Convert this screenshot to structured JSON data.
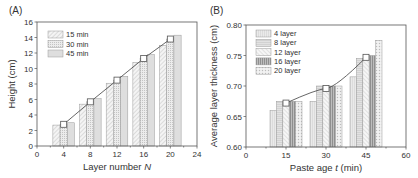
{
  "chart_data": [
    {
      "type": "bar",
      "panel": "(A)",
      "title": "",
      "xlabel": "Layer number",
      "xlabel_italic": "N",
      "ylabel": "Height (cm)",
      "xlim": [
        0,
        24
      ],
      "ylim": [
        0,
        16
      ],
      "xticks": [
        "0",
        "4",
        "8",
        "12",
        "16",
        "20",
        "24"
      ],
      "yticks": [
        "0",
        "2",
        "4",
        "6",
        "8",
        "10",
        "12",
        "14",
        "16"
      ],
      "categories": [
        4,
        8,
        12,
        16,
        20
      ],
      "series": [
        {
          "name": "15 min",
          "values": [
            2.7,
            5.4,
            8.1,
            10.8,
            13.0
          ]
        },
        {
          "name": "30 min",
          "values": [
            2.8,
            5.7,
            8.5,
            11.3,
            13.8
          ]
        },
        {
          "name": "45 min",
          "values": [
            3.0,
            6.1,
            9.0,
            11.8,
            14.3
          ]
        }
      ],
      "line": {
        "name": "fit",
        "x": [
          4,
          8,
          12,
          16,
          20
        ],
        "y": [
          2.8,
          5.7,
          8.5,
          11.3,
          13.8
        ]
      },
      "legend_position": "upper-left",
      "grid": false
    },
    {
      "type": "bar",
      "panel": "(B)",
      "title": "",
      "xlabel": "Paste age",
      "xlabel_italic": "t",
      "xlabel_unit": "(min)",
      "ylabel": "Average layer thickness (cm)",
      "xlim": [
        0,
        60
      ],
      "ylim": [
        0.6,
        0.8
      ],
      "xticks": [
        "0",
        "15",
        "30",
        "45",
        "60"
      ],
      "yticks": [
        "0.60",
        "0.65",
        "0.70",
        "0.75",
        "0.80"
      ],
      "categories": [
        15,
        30,
        45
      ],
      "series": [
        {
          "name": "4  layer",
          "values": [
            0.66,
            0.675,
            0.715
          ]
        },
        {
          "name": "8  layer",
          "values": [
            0.675,
            0.7,
            0.745
          ]
        },
        {
          "name": "12 layer",
          "values": [
            0.675,
            0.7,
            0.745
          ]
        },
        {
          "name": "16 layer",
          "values": [
            0.675,
            0.7,
            0.75
          ]
        },
        {
          "name": "20 layer",
          "values": [
            0.675,
            0.7,
            0.775
          ]
        }
      ],
      "line": {
        "name": "mean",
        "x": [
          15,
          30,
          45
        ],
        "y": [
          0.672,
          0.696,
          0.747
        ]
      },
      "legend_position": "upper-left",
      "grid": false
    }
  ]
}
